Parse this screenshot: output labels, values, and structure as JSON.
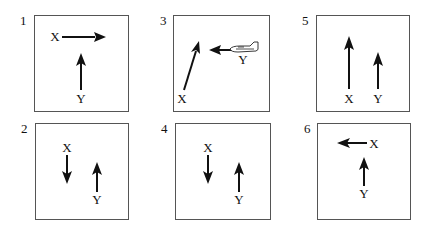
{
  "figure": {
    "panels": [
      {
        "id": "1",
        "number": "1",
        "x_label": "X",
        "y_label": "Y",
        "x_direction": "right",
        "y_direction": "up"
      },
      {
        "id": "3",
        "number": "3",
        "x_label": "X",
        "y_label": "Y",
        "x_direction": "up-right (diagonal)",
        "y_direction": "left",
        "y_object": "airplane"
      },
      {
        "id": "5",
        "number": "5",
        "x_label": "X",
        "y_label": "Y",
        "x_direction": "up (long)",
        "y_direction": "up (short)"
      },
      {
        "id": "2",
        "number": "2",
        "x_label": "X",
        "y_label": "Y",
        "x_direction": "down",
        "y_direction": "up"
      },
      {
        "id": "4",
        "number": "4",
        "x_label": "X",
        "y_label": "Y",
        "x_direction": "down",
        "y_direction": "up"
      },
      {
        "id": "6",
        "number": "6",
        "x_label": "X",
        "y_label": "Y",
        "x_direction": "left",
        "y_direction": "up"
      }
    ]
  },
  "colors": {
    "ink": "#111111",
    "frame": "#555555",
    "background": "#ffffff"
  }
}
